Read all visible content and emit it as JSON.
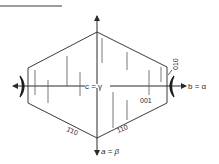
{
  "figure": {
    "type": "crystal optical orientation diagram",
    "colors": {
      "line": "#3a3a3a",
      "text": "#2a2a2a",
      "background": "#ffffff"
    }
  },
  "axes": {
    "vertical_center_label": "c = γ",
    "horizontal_right_label": "b = α",
    "vertical_bottom_label": "a = β"
  },
  "faces": {
    "upper_right": "010",
    "center_right": "001",
    "lower_left": "1̄10",
    "lower_right": "110"
  },
  "header_rule": {
    "visible": true
  }
}
